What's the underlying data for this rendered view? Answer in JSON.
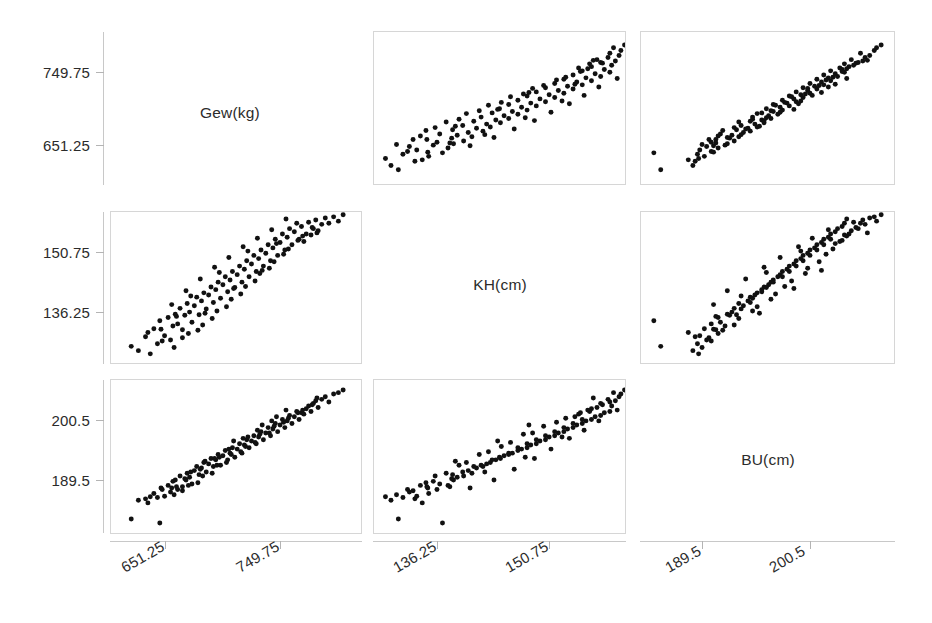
{
  "figure": {
    "type": "scatterplot-matrix",
    "variables": [
      "Gew(kg)",
      "KH(cm)",
      "BU(cm)"
    ],
    "diagonal_labels": {
      "gew": "Gew(kg)",
      "kh": "KH(cm)",
      "bu": "BU(cm)"
    }
  },
  "axes": {
    "row1_y_ticks": [
      "749.75",
      "651.25"
    ],
    "row2_y_ticks": [
      "150.75",
      "136.25"
    ],
    "row3_y_ticks": [
      "200.5",
      "189.5"
    ],
    "col1_x_ticks": [
      "651.25",
      "749.75"
    ],
    "col2_x_ticks": [
      "136.25",
      "150.75"
    ],
    "col3_x_ticks": [
      "189.5",
      "200.5"
    ]
  },
  "chart_data": {
    "type": "scatter",
    "title": "",
    "subtitle": "",
    "xlabel": "",
    "ylabel": "",
    "grid": false,
    "legend": "none",
    "layout": "3x3 scatterplot matrix (pairs plot); diagonal cells show variable names",
    "variables": [
      {
        "key": "Gew",
        "label": "Gew(kg)",
        "unit": "kg",
        "ticks": [
          651.25,
          749.75
        ],
        "range": [
          600.0,
          800.0
        ]
      },
      {
        "key": "KH",
        "label": "KH(cm)",
        "unit": "cm",
        "ticks": [
          136.25,
          150.75
        ],
        "range": [
          131.0,
          157.0
        ]
      },
      {
        "key": "BU",
        "label": "BU(cm)",
        "unit": "cm",
        "ticks": [
          189.5,
          200.5
        ],
        "range": [
          185.0,
          206.0
        ]
      }
    ],
    "n_observations": 120,
    "observations": [
      {
        "Gew": 612,
        "KH": 133.0,
        "BU": 186.2
      },
      {
        "Gew": 618,
        "KH": 132.2,
        "BU": 189.0
      },
      {
        "Gew": 624,
        "KH": 134.8,
        "BU": 189.2
      },
      {
        "Gew": 628,
        "KH": 131.6,
        "BU": 189.5
      },
      {
        "Gew": 631,
        "KH": 136.3,
        "BU": 190.0
      },
      {
        "Gew": 634,
        "KH": 133.5,
        "BU": 189.4
      },
      {
        "Gew": 637,
        "KH": 136.2,
        "BU": 190.8
      },
      {
        "Gew": 640,
        "KH": 135.0,
        "BU": 189.6
      },
      {
        "Gew": 643,
        "KH": 138.4,
        "BU": 191.2
      },
      {
        "Gew": 645,
        "KH": 134.2,
        "BU": 190.2
      },
      {
        "Gew": 647,
        "KH": 136.8,
        "BU": 191.8
      },
      {
        "Gew": 649,
        "KH": 139.0,
        "BU": 192.0
      },
      {
        "Gew": 651,
        "KH": 137.2,
        "BU": 190.6
      },
      {
        "Gew": 653,
        "KH": 140.1,
        "BU": 192.6
      },
      {
        "Gew": 655,
        "KH": 136.1,
        "BU": 191.0
      },
      {
        "Gew": 657,
        "KH": 138.8,
        "BU": 192.2
      },
      {
        "Gew": 659,
        "KH": 141.0,
        "BU": 193.0
      },
      {
        "Gew": 661,
        "KH": 139.4,
        "BU": 192.4
      },
      {
        "Gew": 663,
        "KH": 137.5,
        "BU": 191.4
      },
      {
        "Gew": 665,
        "KH": 140.6,
        "BU": 193.4
      },
      {
        "Gew": 667,
        "KH": 142.2,
        "BU": 194.0
      },
      {
        "Gew": 669,
        "KH": 138.9,
        "BU": 192.8
      },
      {
        "Gew": 671,
        "KH": 141.5,
        "BU": 193.8
      },
      {
        "Gew": 673,
        "KH": 143.0,
        "BU": 194.6
      },
      {
        "Gew": 675,
        "KH": 140.0,
        "BU": 193.2
      },
      {
        "Gew": 677,
        "KH": 142.6,
        "BU": 194.4
      },
      {
        "Gew": 679,
        "KH": 144.1,
        "BU": 195.2
      },
      {
        "Gew": 681,
        "KH": 141.2,
        "BU": 194.0
      },
      {
        "Gew": 683,
        "KH": 143.6,
        "BU": 195.0
      },
      {
        "Gew": 685,
        "KH": 145.0,
        "BU": 195.8
      },
      {
        "Gew": 687,
        "KH": 142.0,
        "BU": 194.2
      },
      {
        "Gew": 689,
        "KH": 144.5,
        "BU": 195.6
      },
      {
        "Gew": 691,
        "KH": 146.0,
        "BU": 196.4
      },
      {
        "Gew": 693,
        "KH": 143.2,
        "BU": 195.0
      },
      {
        "Gew": 695,
        "KH": 145.4,
        "BU": 196.0
      },
      {
        "Gew": 697,
        "KH": 147.0,
        "BU": 196.8
      },
      {
        "Gew": 699,
        "KH": 144.0,
        "BU": 195.4
      },
      {
        "Gew": 701,
        "KH": 146.4,
        "BU": 196.6
      },
      {
        "Gew": 703,
        "KH": 148.0,
        "BU": 197.4
      },
      {
        "Gew": 705,
        "KH": 145.0,
        "BU": 196.0
      },
      {
        "Gew": 707,
        "KH": 147.4,
        "BU": 197.2
      },
      {
        "Gew": 709,
        "KH": 149.0,
        "BU": 198.0
      },
      {
        "Gew": 711,
        "KH": 146.0,
        "BU": 196.8
      },
      {
        "Gew": 713,
        "KH": 148.4,
        "BU": 197.8
      },
      {
        "Gew": 715,
        "KH": 150.0,
        "BU": 198.6
      },
      {
        "Gew": 717,
        "KH": 147.0,
        "BU": 197.4
      },
      {
        "Gew": 719,
        "KH": 149.4,
        "BU": 198.4
      },
      {
        "Gew": 721,
        "KH": 151.0,
        "BU": 199.2
      },
      {
        "Gew": 723,
        "KH": 148.0,
        "BU": 198.0
      },
      {
        "Gew": 725,
        "KH": 150.4,
        "BU": 199.0
      },
      {
        "Gew": 727,
        "KH": 152.0,
        "BU": 199.8
      },
      {
        "Gew": 729,
        "KH": 149.0,
        "BU": 198.6
      },
      {
        "Gew": 731,
        "KH": 151.4,
        "BU": 199.6
      },
      {
        "Gew": 733,
        "KH": 153.0,
        "BU": 200.4
      },
      {
        "Gew": 735,
        "KH": 150.0,
        "BU": 199.2
      },
      {
        "Gew": 737,
        "KH": 152.4,
        "BU": 200.2
      },
      {
        "Gew": 739,
        "KH": 154.0,
        "BU": 201.0
      },
      {
        "Gew": 741,
        "KH": 151.0,
        "BU": 199.8
      },
      {
        "Gew": 743,
        "KH": 153.4,
        "BU": 200.8
      },
      {
        "Gew": 745,
        "KH": 155.0,
        "BU": 201.6
      },
      {
        "Gew": 747,
        "KH": 152.0,
        "BU": 200.4
      },
      {
        "Gew": 749,
        "KH": 154.4,
        "BU": 201.4
      },
      {
        "Gew": 751,
        "KH": 156.0,
        "BU": 202.2
      },
      {
        "Gew": 753,
        "KH": 153.0,
        "BU": 201.0
      },
      {
        "Gew": 755,
        "KH": 155.4,
        "BU": 202.0
      },
      {
        "Gew": 757,
        "KH": 152.6,
        "BU": 201.8
      },
      {
        "Gew": 759,
        "KH": 154.0,
        "BU": 202.6
      },
      {
        "Gew": 761,
        "KH": 156.2,
        "BU": 203.0
      },
      {
        "Gew": 763,
        "KH": 153.8,
        "BU": 202.2
      },
      {
        "Gew": 765,
        "KH": 155.0,
        "BU": 203.4
      },
      {
        "Gew": 767,
        "KH": 156.6,
        "BU": 203.8
      },
      {
        "Gew": 769,
        "KH": 154.6,
        "BU": 202.8
      },
      {
        "Gew": 772,
        "KH": 155.8,
        "BU": 204.0
      },
      {
        "Gew": 775,
        "KH": 157.0,
        "BU": 204.4
      },
      {
        "Gew": 778,
        "KH": 156.0,
        "BU": 203.6
      },
      {
        "Gew": 782,
        "KH": 157.2,
        "BU": 204.8
      },
      {
        "Gew": 786,
        "KH": 156.4,
        "BU": 205.0
      },
      {
        "Gew": 790,
        "KH": 157.6,
        "BU": 205.4
      },
      {
        "Gew": 655,
        "KH": 134.6,
        "BU": 190.4
      },
      {
        "Gew": 668,
        "KH": 136.0,
        "BU": 191.6
      },
      {
        "Gew": 680,
        "KH": 138.2,
        "BU": 193.0
      },
      {
        "Gew": 692,
        "KH": 140.4,
        "BU": 194.6
      },
      {
        "Gew": 704,
        "KH": 142.8,
        "BU": 196.2
      },
      {
        "Gew": 716,
        "KH": 145.2,
        "BU": 197.6
      },
      {
        "Gew": 728,
        "KH": 147.6,
        "BU": 199.0
      },
      {
        "Gew": 740,
        "KH": 150.2,
        "BU": 200.6
      },
      {
        "Gew": 752,
        "KH": 152.8,
        "BU": 202.0
      },
      {
        "Gew": 764,
        "KH": 155.2,
        "BU": 203.2
      },
      {
        "Gew": 646,
        "KH": 140.8,
        "BU": 190.8
      },
      {
        "Gew": 658,
        "KH": 143.4,
        "BU": 192.0
      },
      {
        "Gew": 670,
        "KH": 145.6,
        "BU": 193.6
      },
      {
        "Gew": 682,
        "KH": 147.8,
        "BU": 195.2
      },
      {
        "Gew": 694,
        "KH": 149.6,
        "BU": 196.6
      },
      {
        "Gew": 706,
        "KH": 151.6,
        "BU": 198.2
      },
      {
        "Gew": 718,
        "KH": 153.2,
        "BU": 199.4
      },
      {
        "Gew": 730,
        "KH": 154.8,
        "BU": 200.8
      },
      {
        "Gew": 742,
        "KH": 156.8,
        "BU": 202.4
      },
      {
        "Gew": 636,
        "KH": 137.8,
        "BU": 185.6
      },
      {
        "Gew": 648,
        "KH": 132.8,
        "BU": 189.8
      },
      {
        "Gew": 660,
        "KH": 135.4,
        "BU": 191.2
      },
      {
        "Gew": 672,
        "KH": 137.0,
        "BU": 192.6
      },
      {
        "Gew": 684,
        "KH": 139.6,
        "BU": 194.2
      },
      {
        "Gew": 696,
        "KH": 141.8,
        "BU": 195.8
      },
      {
        "Gew": 708,
        "KH": 144.2,
        "BU": 197.0
      },
      {
        "Gew": 720,
        "KH": 146.6,
        "BU": 198.8
      },
      {
        "Gew": 732,
        "KH": 148.8,
        "BU": 200.0
      },
      {
        "Gew": 744,
        "KH": 151.2,
        "BU": 201.2
      },
      {
        "Gew": 756,
        "KH": 153.6,
        "BU": 202.4
      },
      {
        "Gew": 768,
        "KH": 154.2,
        "BU": 204.2
      },
      {
        "Gew": 626,
        "KH": 135.6,
        "BU": 188.6
      },
      {
        "Gew": 638,
        "KH": 134.0,
        "BU": 190.6
      },
      {
        "Gew": 650,
        "KH": 138.6,
        "BU": 191.0
      },
      {
        "Gew": 662,
        "KH": 142.4,
        "BU": 193.2
      },
      {
        "Gew": 674,
        "KH": 139.2,
        "BU": 194.8
      },
      {
        "Gew": 686,
        "KH": 146.8,
        "BU": 195.4
      },
      {
        "Gew": 698,
        "KH": 143.8,
        "BU": 197.8
      },
      {
        "Gew": 710,
        "KH": 150.8,
        "BU": 198.4
      },
      {
        "Gew": 722,
        "KH": 147.2,
        "BU": 200.2
      },
      {
        "Gew": 734,
        "KH": 152.2,
        "BU": 201.4
      }
    ]
  }
}
